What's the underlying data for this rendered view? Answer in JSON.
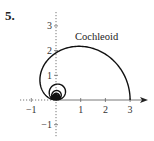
{
  "problem_number": "5.",
  "chart_data": {
    "type": "line",
    "title": "",
    "curve_label": "Cochleoid",
    "equation": "r = sin(θ)/θ",
    "xlabel": "",
    "ylabel": "",
    "xlim": [
      -1.2,
      3.6
    ],
    "ylim": [
      -1.5,
      3.6
    ],
    "grid": false,
    "x_ticks": [
      -1,
      1,
      2,
      3
    ],
    "x_tick_labels": [
      "−1",
      "1",
      "2",
      "3"
    ],
    "y_ticks": [
      3,
      2,
      1,
      -1
    ],
    "y_tick_labels": [
      "3",
      "2",
      "1",
      "−1"
    ],
    "series": [
      {
        "name": "Cochleoid",
        "description": "Polar curve spiraling inward toward origin",
        "points_sample": [
          [
            3.0,
            0.0
          ],
          [
            2.6,
            1.5
          ],
          [
            1.0,
            2.2
          ],
          [
            0.0,
            2.0
          ],
          [
            -1.0,
            1.0
          ],
          [
            -0.9,
            0.2
          ],
          [
            0.0,
            0.0
          ]
        ]
      }
    ],
    "colors": {
      "curve": "#111111",
      "axis": "#555555",
      "background": "#ffffff"
    }
  },
  "layout": {
    "origin_px": [
      56,
      100
    ],
    "unit_px": 24.7
  }
}
